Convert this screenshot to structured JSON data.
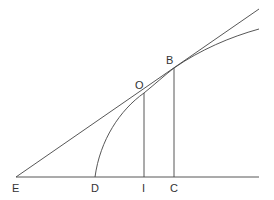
{
  "figure": {
    "colors": {
      "line": "#444444",
      "label": "#333333",
      "background": "#ffffff"
    },
    "points": {
      "E": {
        "label": "E",
        "x": 16,
        "y": 177
      },
      "D": {
        "label": "D",
        "x": 95,
        "y": 177
      },
      "I": {
        "label": "I",
        "x": 144,
        "y": 177
      },
      "C": {
        "label": "C",
        "x": 174,
        "y": 177
      },
      "O": {
        "label": "O",
        "x": 144,
        "y": 93
      },
      "B": {
        "label": "B",
        "x": 174,
        "y": 68
      }
    },
    "labels": {
      "E": "E",
      "D": "D",
      "I": "I",
      "C": "C",
      "O": "O",
      "B": "B"
    }
  }
}
